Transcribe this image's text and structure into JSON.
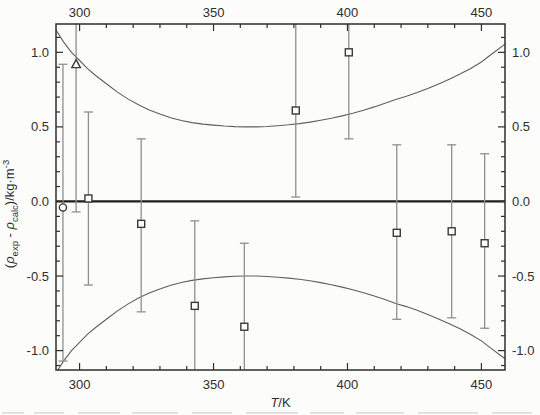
{
  "figure": {
    "title": "",
    "xlabel_italic": "T",
    "xlabel_rest": "/K",
    "ylabel_parts": {
      "open": "(",
      "rho": "ρ",
      "sub_exp": "exp",
      "minus": " - ",
      "sub_calc": "calc",
      "close": ")/kg·m",
      "sup": "-3"
    }
  },
  "colors": {
    "background": "#fcfcfb",
    "axis": "#2e2e2e",
    "text": "#2e2e2e",
    "zero_line": "#1d1d1d",
    "curve": "#5f5f5f",
    "error_bar": "#8f8f8f",
    "marker": "#3a3a3a",
    "marker_fill": "#fcfcfb",
    "artifact": "#bdbdbd"
  },
  "chart_data": {
    "type": "scatter",
    "title": "",
    "xlabel": "T/K",
    "ylabel": "(rho_exp - rho_calc)/kg·m^-3",
    "grid": false,
    "legend": "none",
    "x_axis": {
      "min": 291.2,
      "max": 458.8,
      "major_ticks": [
        300,
        350,
        400,
        450
      ],
      "tick_labels": [
        "300",
        "350",
        "400",
        "450"
      ],
      "minor_tick_step": 10,
      "label_sides": [
        "bottom",
        "top"
      ]
    },
    "y_axis": {
      "min": -1.13,
      "max": 1.19,
      "major_ticks": [
        1.0,
        0.5,
        0.0,
        -0.5,
        -1.0
      ],
      "tick_labels": [
        "1.0",
        "0.5",
        "0.0",
        "-0.5",
        "-1.0"
      ],
      "minor_tick_step": 0.1,
      "label_sides": [
        "left",
        "right"
      ]
    },
    "zero_line": true,
    "series": [
      {
        "name": "square-points",
        "marker": "square",
        "points": [
          {
            "x": 303.3,
            "y": 0.02,
            "err_lo": -0.56,
            "err_hi": 0.6,
            "cap_lo": true,
            "cap_hi": true
          },
          {
            "x": 323.0,
            "y": -0.15,
            "err_lo": -0.74,
            "err_hi": 0.42,
            "cap_lo": true,
            "cap_hi": true
          },
          {
            "x": 343.0,
            "y": -0.7,
            "err_lo": -1.13,
            "err_hi": -0.13,
            "cap_lo": false,
            "cap_hi": true
          },
          {
            "x": 361.5,
            "y": -0.84,
            "err_lo": -1.13,
            "err_hi": -0.28,
            "cap_lo": false,
            "cap_hi": true
          },
          {
            "x": 380.7,
            "y": 0.61,
            "err_lo": 0.03,
            "err_hi": 1.19,
            "cap_lo": true,
            "cap_hi": false
          },
          {
            "x": 400.5,
            "y": 1.0,
            "err_lo": 0.42,
            "err_hi": 1.19,
            "cap_lo": true,
            "cap_hi": false
          },
          {
            "x": 418.4,
            "y": -0.21,
            "err_lo": -0.79,
            "err_hi": 0.38,
            "cap_lo": true,
            "cap_hi": true
          },
          {
            "x": 438.9,
            "y": -0.2,
            "err_lo": -0.78,
            "err_hi": 0.38,
            "cap_lo": true,
            "cap_hi": true
          },
          {
            "x": 451.2,
            "y": -0.28,
            "err_lo": -0.85,
            "err_hi": 0.32,
            "cap_lo": true,
            "cap_hi": true
          }
        ]
      },
      {
        "name": "circle-point",
        "marker": "circle",
        "points": [
          {
            "x": 293.8,
            "y": -0.04,
            "err_lo": -1.07,
            "err_hi": 0.92,
            "cap_lo": true,
            "cap_hi": true
          }
        ]
      },
      {
        "name": "triangle-point",
        "marker": "triangle",
        "points": [
          {
            "x": 298.7,
            "y": 0.92,
            "err_lo": -0.07,
            "err_hi": 1.19,
            "cap_lo": true,
            "cap_hi": false
          }
        ]
      }
    ],
    "confidence_band": {
      "upper": [
        [
          291.2,
          1.15
        ],
        [
          294,
          1.07
        ],
        [
          297,
          1.0
        ],
        [
          300,
          0.945
        ],
        [
          303,
          0.89
        ],
        [
          306,
          0.845
        ],
        [
          310,
          0.79
        ],
        [
          314,
          0.735
        ],
        [
          318,
          0.688
        ],
        [
          322,
          0.648
        ],
        [
          326,
          0.614
        ],
        [
          330,
          0.586
        ],
        [
          334,
          0.562
        ],
        [
          338,
          0.543
        ],
        [
          342,
          0.529
        ],
        [
          346,
          0.519
        ],
        [
          350,
          0.512
        ],
        [
          354,
          0.506
        ],
        [
          358,
          0.502
        ],
        [
          362,
          0.5
        ],
        [
          366,
          0.5
        ],
        [
          370,
          0.503
        ],
        [
          374,
          0.508
        ],
        [
          378,
          0.514
        ],
        [
          382,
          0.522
        ],
        [
          386,
          0.532
        ],
        [
          390,
          0.544
        ],
        [
          394,
          0.558
        ],
        [
          398,
          0.574
        ],
        [
          402,
          0.592
        ],
        [
          406,
          0.612
        ],
        [
          410,
          0.634
        ],
        [
          414,
          0.658
        ],
        [
          418,
          0.684
        ],
        [
          422,
          0.705
        ],
        [
          426,
          0.73
        ],
        [
          430,
          0.758
        ],
        [
          434,
          0.788
        ],
        [
          438,
          0.82
        ],
        [
          442,
          0.854
        ],
        [
          446,
          0.892
        ],
        [
          450,
          0.935
        ],
        [
          454,
          0.99
        ],
        [
          458.8,
          1.055
        ]
      ],
      "lower": [
        [
          291.2,
          -1.15
        ],
        [
          294,
          -1.07
        ],
        [
          297,
          -1.0
        ],
        [
          300,
          -0.945
        ],
        [
          303,
          -0.89
        ],
        [
          306,
          -0.845
        ],
        [
          310,
          -0.79
        ],
        [
          314,
          -0.735
        ],
        [
          318,
          -0.688
        ],
        [
          322,
          -0.648
        ],
        [
          326,
          -0.614
        ],
        [
          330,
          -0.586
        ],
        [
          334,
          -0.562
        ],
        [
          338,
          -0.543
        ],
        [
          342,
          -0.529
        ],
        [
          346,
          -0.519
        ],
        [
          350,
          -0.512
        ],
        [
          354,
          -0.506
        ],
        [
          358,
          -0.502
        ],
        [
          362,
          -0.5
        ],
        [
          366,
          -0.5
        ],
        [
          370,
          -0.503
        ],
        [
          374,
          -0.508
        ],
        [
          378,
          -0.514
        ],
        [
          382,
          -0.522
        ],
        [
          386,
          -0.532
        ],
        [
          390,
          -0.544
        ],
        [
          394,
          -0.558
        ],
        [
          398,
          -0.574
        ],
        [
          402,
          -0.592
        ],
        [
          406,
          -0.612
        ],
        [
          410,
          -0.634
        ],
        [
          414,
          -0.658
        ],
        [
          418,
          -0.684
        ],
        [
          422,
          -0.705
        ],
        [
          426,
          -0.73
        ],
        [
          430,
          -0.758
        ],
        [
          434,
          -0.788
        ],
        [
          438,
          -0.82
        ],
        [
          442,
          -0.854
        ],
        [
          446,
          -0.892
        ],
        [
          450,
          -0.935
        ],
        [
          454,
          -0.99
        ],
        [
          458.8,
          -1.055
        ]
      ]
    }
  }
}
